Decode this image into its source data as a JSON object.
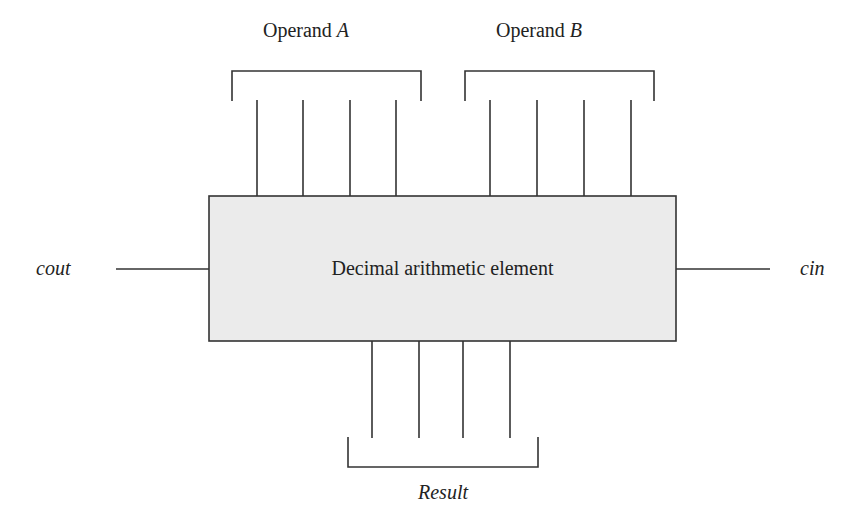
{
  "diagram": {
    "block": {
      "label": "Decimal arithmetic element",
      "fill": "#ebebeb",
      "stroke": "#333333"
    },
    "inputs": {
      "operand_a": {
        "label_prefix": "Operand ",
        "label_var": "A",
        "lines": 4
      },
      "operand_b": {
        "label_prefix": "Operand ",
        "label_var": "B",
        "lines": 4
      },
      "carry_in": {
        "label": "cin"
      }
    },
    "outputs": {
      "result": {
        "label": "Result",
        "lines": 4
      },
      "carry_out": {
        "label": "cout"
      }
    }
  }
}
